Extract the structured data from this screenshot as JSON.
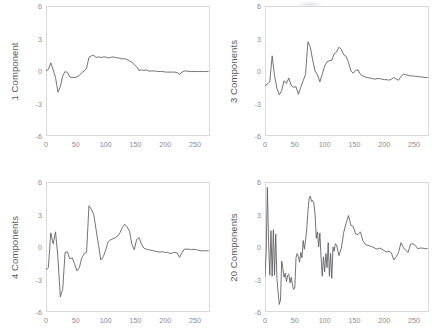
{
  "figure": {
    "background": "#ffffff",
    "line_color": "#5a5a5e",
    "frame_color": "#d9d9dd",
    "tick_color": "#8b8b8d",
    "label_color": "#58585a",
    "panels_layout": "2x2"
  },
  "chart_data": [
    {
      "type": "line",
      "panel": "top-left",
      "title": "",
      "xlabel": "",
      "ylabel": "1 Component",
      "xlim": [
        0,
        275
      ],
      "ylim": [
        -6,
        6
      ],
      "xticks": [
        0,
        50,
        100,
        150,
        200,
        250
      ],
      "yticks": [
        6,
        3,
        0,
        -3,
        -6
      ],
      "grid": false,
      "legend": "none",
      "x": [
        0,
        4,
        8,
        12,
        16,
        20,
        24,
        28,
        32,
        36,
        40,
        44,
        48,
        52,
        56,
        60,
        64,
        68,
        72,
        76,
        80,
        84,
        88,
        92,
        96,
        100,
        104,
        108,
        112,
        116,
        120,
        124,
        128,
        132,
        136,
        140,
        144,
        148,
        152,
        156,
        160,
        164,
        168,
        172,
        176,
        180,
        184,
        188,
        192,
        196,
        200,
        204,
        208,
        212,
        216,
        220,
        224,
        228,
        232,
        236,
        240,
        244,
        248,
        252,
        256,
        260,
        264,
        268,
        272
      ],
      "values": [
        0.0,
        0.15,
        0.75,
        0.1,
        -0.6,
        -1.95,
        -1.45,
        -0.45,
        -0.05,
        -0.15,
        -0.55,
        -0.6,
        -0.6,
        -0.55,
        -0.4,
        -0.15,
        0.0,
        0.25,
        1.25,
        1.4,
        1.45,
        1.25,
        1.3,
        1.25,
        1.3,
        1.3,
        1.2,
        1.25,
        1.3,
        1.25,
        1.2,
        1.2,
        1.1,
        1.15,
        1.05,
        0.95,
        0.8,
        0.6,
        0.4,
        0.05,
        0.1,
        0.05,
        0.1,
        0.0,
        0.0,
        0.0,
        0.0,
        -0.05,
        -0.05,
        -0.05,
        -0.1,
        -0.1,
        -0.1,
        -0.1,
        -0.1,
        -0.15,
        -0.3,
        -0.1,
        0.0,
        0.0,
        -0.05,
        -0.05,
        -0.05,
        -0.05,
        -0.05,
        -0.05,
        -0.05,
        -0.05,
        -0.05
      ]
    },
    {
      "type": "line",
      "panel": "top-right",
      "title": "",
      "xlabel": "",
      "ylabel": "3 Components",
      "xlim": [
        0,
        275
      ],
      "ylim": [
        -6,
        6
      ],
      "xticks": [
        0,
        50,
        100,
        150,
        200,
        250
      ],
      "yticks": [
        6,
        3,
        0,
        -3,
        -6
      ],
      "grid": false,
      "legend": "none",
      "x": [
        0,
        4,
        8,
        12,
        16,
        20,
        24,
        28,
        32,
        36,
        40,
        44,
        48,
        52,
        56,
        60,
        64,
        68,
        72,
        76,
        80,
        84,
        88,
        92,
        96,
        100,
        104,
        108,
        112,
        116,
        120,
        124,
        128,
        132,
        136,
        140,
        144,
        148,
        152,
        156,
        160,
        164,
        168,
        172,
        176,
        180,
        184,
        188,
        192,
        196,
        200,
        204,
        208,
        212,
        216,
        220,
        224,
        228,
        232,
        236,
        240,
        244,
        248,
        252,
        256,
        260,
        264,
        268,
        272
      ],
      "values": [
        -1.35,
        -1.2,
        -1.0,
        1.4,
        -0.4,
        -1.6,
        -2.2,
        -1.8,
        -0.9,
        -1.15,
        -0.65,
        -1.35,
        -1.5,
        -1.45,
        -2.15,
        -1.5,
        -0.9,
        -0.3,
        2.7,
        2.2,
        1.0,
        0.0,
        -0.35,
        -1.0,
        -0.3,
        0.45,
        0.85,
        0.95,
        1.0,
        1.6,
        1.75,
        2.2,
        2.0,
        1.5,
        1.35,
        0.8,
        0.0,
        -0.2,
        0.05,
        0.1,
        -0.3,
        -0.45,
        -0.55,
        -0.6,
        -0.65,
        -0.7,
        -0.75,
        -0.7,
        -0.7,
        -0.75,
        -0.8,
        -0.8,
        -0.85,
        -0.75,
        -0.6,
        -0.75,
        -0.85,
        -0.5,
        -0.3,
        -0.35,
        -0.4,
        -0.45,
        -0.45,
        -0.5,
        -0.5,
        -0.55,
        -0.55,
        -0.6,
        -0.6
      ]
    },
    {
      "type": "line",
      "panel": "bottom-left",
      "title": "",
      "xlabel": "",
      "ylabel": "4 Components",
      "xlim": [
        0,
        275
      ],
      "ylim": [
        -6,
        6
      ],
      "xticks": [
        0,
        50,
        100,
        150,
        200,
        250
      ],
      "yticks": [
        6,
        3,
        0,
        -3,
        -6
      ],
      "grid": false,
      "legend": "none",
      "x": [
        0,
        4,
        8,
        12,
        16,
        20,
        24,
        28,
        32,
        36,
        40,
        44,
        48,
        52,
        56,
        60,
        64,
        68,
        72,
        76,
        80,
        84,
        88,
        92,
        96,
        100,
        104,
        108,
        112,
        116,
        120,
        124,
        128,
        132,
        136,
        140,
        144,
        148,
        152,
        156,
        160,
        164,
        168,
        172,
        176,
        180,
        184,
        188,
        192,
        196,
        200,
        204,
        208,
        212,
        216,
        220,
        224,
        228,
        232,
        236,
        240,
        244,
        248,
        252,
        256,
        260,
        264,
        268,
        272
      ],
      "values": [
        -2.1,
        -1.9,
        1.3,
        0.3,
        1.4,
        -1.0,
        -4.6,
        -3.9,
        -0.5,
        -0.45,
        -1.1,
        -1.0,
        -1.6,
        -2.2,
        -1.9,
        -1.0,
        -0.6,
        -0.5,
        3.8,
        3.5,
        3.0,
        1.6,
        0.2,
        -1.2,
        -0.9,
        -0.3,
        0.45,
        0.65,
        0.75,
        0.85,
        1.0,
        1.3,
        1.8,
        2.1,
        1.85,
        1.45,
        0.25,
        -0.25,
        0.7,
        0.85,
        0.3,
        -0.1,
        -0.2,
        -0.25,
        -0.3,
        -0.35,
        -0.4,
        -0.45,
        -0.45,
        -0.45,
        -0.5,
        -0.5,
        -0.6,
        -0.55,
        -0.5,
        -0.55,
        -0.95,
        -0.55,
        -0.2,
        -0.2,
        -0.2,
        -0.25,
        -0.2,
        -0.25,
        -0.3,
        -0.35,
        -0.35,
        -0.35,
        -0.35
      ]
    },
    {
      "type": "line",
      "panel": "bottom-right",
      "title": "",
      "xlabel": "",
      "ylabel": "20 Components",
      "xlim": [
        0,
        275
      ],
      "ylim": [
        -6,
        6
      ],
      "xticks": [
        0,
        50,
        100,
        150,
        200,
        250
      ],
      "yticks": [
        6,
        3,
        0,
        -3,
        -6
      ],
      "grid": false,
      "legend": "none",
      "x": [
        0,
        2,
        4,
        6,
        8,
        10,
        12,
        14,
        16,
        18,
        20,
        22,
        24,
        26,
        28,
        30,
        32,
        34,
        36,
        38,
        40,
        42,
        44,
        46,
        48,
        50,
        52,
        54,
        56,
        58,
        60,
        62,
        64,
        66,
        68,
        70,
        72,
        74,
        76,
        78,
        80,
        82,
        84,
        86,
        88,
        90,
        92,
        94,
        96,
        98,
        100,
        102,
        104,
        106,
        108,
        110,
        112,
        114,
        116,
        118,
        120,
        124,
        128,
        132,
        136,
        140,
        144,
        148,
        152,
        156,
        160,
        164,
        168,
        172,
        176,
        180,
        184,
        188,
        192,
        196,
        200,
        204,
        208,
        212,
        216,
        220,
        224,
        228,
        232,
        236,
        240,
        244,
        248,
        252,
        256,
        260,
        264,
        268,
        272
      ],
      "values": [
        -2.7,
        -0.4,
        5.5,
        0.4,
        -2.6,
        1.5,
        -2.7,
        1.6,
        -2.6,
        1.2,
        -2.9,
        -4.2,
        -5.3,
        -4.9,
        -1.3,
        -2.0,
        -2.8,
        -2.4,
        -3.2,
        -2.6,
        -2.5,
        -3.3,
        -2.8,
        -3.5,
        -3.9,
        -3.8,
        -1.0,
        -0.6,
        -0.9,
        -1.4,
        -0.5,
        -1.0,
        0.6,
        -0.2,
        0.6,
        1.7,
        3.3,
        4.5,
        4.7,
        4.2,
        4.3,
        4.0,
        3.0,
        0.8,
        1.4,
        0.0,
        1.3,
        -0.9,
        -2.7,
        -0.9,
        -2.3,
        -0.6,
        -1.9,
        0.4,
        -2.7,
        -0.6,
        -2.9,
        0.0,
        -0.4,
        0.3,
        0.2,
        -0.8,
        -0.1,
        1.35,
        2.2,
        2.9,
        2.0,
        1.9,
        1.2,
        1.15,
        1.4,
        0.6,
        0.25,
        0.15,
        0.1,
        0.0,
        -0.1,
        -0.2,
        -0.1,
        -0.2,
        -0.35,
        -0.45,
        -0.4,
        -0.55,
        -1.2,
        -0.9,
        -0.5,
        0.4,
        -0.05,
        -0.3,
        -0.5,
        0.25,
        0.3,
        0.15,
        -0.15,
        -0.1,
        -0.1,
        -0.15,
        -0.15,
        -0.15
      ]
    }
  ]
}
